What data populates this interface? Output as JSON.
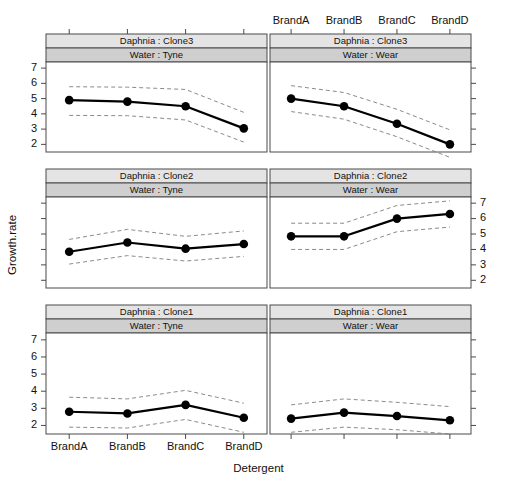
{
  "figure": {
    "kind": "lattice-trellis-conditioning-plot",
    "xlabel": "Detergent",
    "ylabel": "Growth.rate",
    "x_categories": [
      "BrandA",
      "BrandB",
      "BrandC",
      "BrandD"
    ],
    "y_ticks": [
      "7",
      "6",
      "5",
      "4",
      "3",
      "2"
    ],
    "ylim": [
      1.5,
      7.4
    ],
    "strip_label_separator": " : ",
    "colors": {
      "mean_line": "#000000",
      "ci_line": "#7d7d7d",
      "strip_upper": "#e4e4e4",
      "strip_lower": "#cfcfcf",
      "frame": "#4a4a4a",
      "background": "#ffffff"
    }
  },
  "chart_data": {
    "type": "line",
    "title": "",
    "xlabel": "Detergent",
    "ylabel": "Growth.rate",
    "categories": [
      "BrandA",
      "BrandB",
      "BrandC",
      "BrandD"
    ],
    "ylim": [
      1.5,
      7.4
    ],
    "yticks": [
      2,
      3,
      4,
      5,
      6,
      7
    ],
    "grid": false,
    "legend": "none",
    "conditioning_variables": [
      "Daphnia",
      "Water"
    ],
    "panel_layout": {
      "rows": 3,
      "cols": 2,
      "row_order_top_to_bottom": [
        "Clone3",
        "Clone2",
        "Clone1"
      ],
      "col_order_left_to_right": [
        "Tyne",
        "Wear"
      ]
    },
    "panels": [
      {
        "id": "clone3-tyne",
        "row": 0,
        "col": 0,
        "strip_top_var": "Daphnia",
        "strip_top_level": "Clone3",
        "strip_top_label": "Daphnia :  Clone3",
        "strip_bottom_var": "Water",
        "strip_bottom_level": "Tyne",
        "strip_bottom_label": "Water :  Tyne",
        "series": [
          {
            "name": "mean",
            "values": [
              4.9,
              4.8,
              4.5,
              3.05
            ]
          },
          {
            "name": "ci_upper",
            "values": [
              5.78,
              5.75,
              5.6,
              4.1
            ]
          },
          {
            "name": "ci_lower",
            "values": [
              3.9,
              3.88,
              3.6,
              2.15
            ]
          }
        ]
      },
      {
        "id": "clone3-wear",
        "row": 0,
        "col": 1,
        "strip_top_var": "Daphnia",
        "strip_top_level": "Clone3",
        "strip_top_label": "Daphnia :  Clone3",
        "strip_bottom_var": "Water",
        "strip_bottom_level": "Wear",
        "strip_bottom_label": "Water :  Wear",
        "series": [
          {
            "name": "mean",
            "values": [
              5.0,
              4.5,
              3.35,
              2.0
            ]
          },
          {
            "name": "ci_upper",
            "values": [
              5.85,
              5.4,
              4.3,
              2.95
            ]
          },
          {
            "name": "ci_lower",
            "values": [
              4.15,
              3.65,
              2.5,
              1.15
            ]
          }
        ]
      },
      {
        "id": "clone2-tyne",
        "row": 1,
        "col": 0,
        "strip_top_var": "Daphnia",
        "strip_top_level": "Clone2",
        "strip_top_label": "Daphnia :  Clone2",
        "strip_bottom_var": "Water",
        "strip_bottom_level": "Tyne",
        "strip_bottom_label": "Water :  Tyne",
        "series": [
          {
            "name": "mean",
            "values": [
              3.85,
              4.45,
              4.05,
              4.35
            ]
          },
          {
            "name": "ci_upper",
            "values": [
              4.65,
              5.3,
              4.85,
              5.2
            ]
          },
          {
            "name": "ci_lower",
            "values": [
              3.05,
              3.6,
              3.25,
              3.55
            ]
          }
        ]
      },
      {
        "id": "clone2-wear",
        "row": 1,
        "col": 1,
        "strip_top_var": "Daphnia",
        "strip_top_level": "Clone2",
        "strip_top_label": "Daphnia :  Clone2",
        "strip_bottom_var": "Water",
        "strip_bottom_level": "Wear",
        "strip_bottom_label": "Water :  Wear",
        "series": [
          {
            "name": "mean",
            "values": [
              4.85,
              4.85,
              6.0,
              6.3
            ]
          },
          {
            "name": "ci_upper",
            "values": [
              5.7,
              5.7,
              6.85,
              7.15
            ]
          },
          {
            "name": "ci_lower",
            "values": [
              4.0,
              4.0,
              5.15,
              5.45
            ]
          }
        ]
      },
      {
        "id": "clone1-tyne",
        "row": 2,
        "col": 0,
        "strip_top_var": "Daphnia",
        "strip_top_level": "Clone1",
        "strip_top_label": "Daphnia :  Clone1",
        "strip_bottom_var": "Water",
        "strip_bottom_level": "Tyne",
        "strip_bottom_label": "Water :  Tyne",
        "series": [
          {
            "name": "mean",
            "values": [
              2.8,
              2.7,
              3.2,
              2.45
            ]
          },
          {
            "name": "ci_upper",
            "values": [
              3.65,
              3.55,
              4.05,
              3.3
            ]
          },
          {
            "name": "ci_lower",
            "values": [
              1.9,
              1.85,
              2.35,
              1.6
            ]
          }
        ]
      },
      {
        "id": "clone1-wear",
        "row": 2,
        "col": 1,
        "strip_top_var": "Daphnia",
        "strip_top_level": "Clone1",
        "strip_top_label": "Daphnia :  Clone1",
        "strip_bottom_var": "Water",
        "strip_bottom_level": "Wear",
        "strip_bottom_label": "Water :  Wear",
        "series": [
          {
            "name": "mean",
            "values": [
              2.4,
              2.75,
              2.55,
              2.3
            ]
          },
          {
            "name": "ci_upper",
            "values": [
              3.2,
              3.55,
              3.35,
              3.1
            ]
          },
          {
            "name": "ci_lower",
            "values": [
              1.6,
              1.9,
              1.75,
              1.5
            ]
          }
        ]
      }
    ]
  }
}
